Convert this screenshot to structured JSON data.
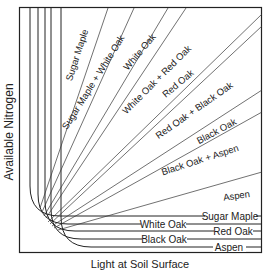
{
  "diagram": {
    "y_axis_label": "Available Nitrogen",
    "x_axis_label": "Light at Soil Surface",
    "diagonal_zones": [
      {
        "label": "Sugar Maple",
        "x": 80,
        "y": 56,
        "angle": -72
      },
      {
        "label": "Sugar Maple + White Oak",
        "x": 96,
        "y": 84,
        "angle": -58
      },
      {
        "label": "White Oak",
        "x": 142,
        "y": 54,
        "angle": -50
      },
      {
        "label": "White Oak + Red Oak",
        "x": 159,
        "y": 82,
        "angle": -45
      },
      {
        "label": "Red Oak",
        "x": 178,
        "y": 86,
        "angle": -40
      },
      {
        "label": "Red Oak + Black Oak",
        "x": 196,
        "y": 113,
        "angle": -35
      },
      {
        "label": "Black Oak",
        "x": 218,
        "y": 134,
        "angle": -28
      },
      {
        "label": "Black Oak + Aspen",
        "x": 201,
        "y": 163,
        "angle": -18
      },
      {
        "label": "Aspen",
        "x": 237,
        "y": 199,
        "angle": -8
      }
    ],
    "horizontal_labels": [
      {
        "label": "Sugar Maple",
        "x": 227,
        "y": 219
      },
      {
        "label": "White Oak",
        "x": 163,
        "y": 227
      },
      {
        "label": "Red Oak",
        "x": 233,
        "y": 234
      },
      {
        "label": "Black Oak",
        "x": 164,
        "y": 242
      },
      {
        "label": "Aspen",
        "x": 229,
        "y": 250
      }
    ],
    "species_curves": [
      {
        "species": "Sugar Maple",
        "vx": 30,
        "hy": 216
      },
      {
        "species": "White Oak",
        "vx": 38,
        "hy": 224
      },
      {
        "species": "Red Oak",
        "vx": 45,
        "hy": 231
      },
      {
        "species": "Black Oak",
        "vx": 51,
        "hy": 239
      },
      {
        "species": "Aspen",
        "vx": 61,
        "hy": 247
      }
    ]
  }
}
